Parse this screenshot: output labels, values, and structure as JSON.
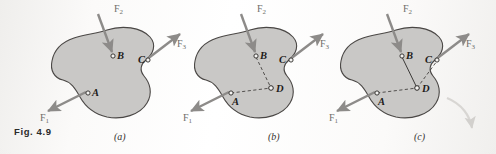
{
  "figure": {
    "caption": "Fig. 4.9",
    "colors": {
      "body_fill": "#c9c8c6",
      "body_stroke": "#4a4745",
      "arrow": "#8d8b89",
      "dashed_line": "#3c3a38",
      "solid_line": "#3c3a38",
      "label_text": "#1d1b1a",
      "force_text": "#6f6d6b",
      "caption_text": "#2b2b2b",
      "page_background": "#f7f6f4",
      "moment_arc": "#d8d6d3"
    }
  },
  "panels": [
    {
      "id": "a",
      "label": "(a)",
      "forces": [
        {
          "name": "F1",
          "label": "F",
          "sub": "1"
        },
        {
          "name": "F2",
          "label": "F",
          "sub": "2"
        },
        {
          "name": "F3",
          "label": "F",
          "sub": "3"
        }
      ],
      "points": [
        {
          "name": "A",
          "label": "A"
        },
        {
          "name": "B",
          "label": "B"
        },
        {
          "name": "C",
          "label": "C"
        }
      ],
      "has_point_d": false,
      "has_moment_arc": false
    },
    {
      "id": "b",
      "label": "(b)",
      "forces": [
        {
          "name": "F1",
          "label": "F",
          "sub": "1"
        },
        {
          "name": "F2",
          "label": "F",
          "sub": "2"
        },
        {
          "name": "F3",
          "label": "F",
          "sub": "3"
        }
      ],
      "points": [
        {
          "name": "A",
          "label": "A"
        },
        {
          "name": "B",
          "label": "B"
        },
        {
          "name": "C",
          "label": "C"
        },
        {
          "name": "D",
          "label": "D"
        }
      ],
      "has_point_d": true,
      "has_moment_arc": false
    },
    {
      "id": "c",
      "label": "(c)",
      "forces": [
        {
          "name": "F1",
          "label": "F",
          "sub": "1"
        },
        {
          "name": "F2",
          "label": "F",
          "sub": "2"
        },
        {
          "name": "F3",
          "label": "F",
          "sub": "3"
        }
      ],
      "points": [
        {
          "name": "A",
          "label": "A"
        },
        {
          "name": "B",
          "label": "B"
        },
        {
          "name": "C",
          "label": "C"
        },
        {
          "name": "D",
          "label": "D"
        }
      ],
      "has_point_d": true,
      "has_moment_arc": true
    }
  ],
  "labels": {
    "a": {
      "F1": "F",
      "F1sub": "1",
      "F2": "F",
      "F2sub": "2",
      "F3": "F",
      "F3sub": "3",
      "A": "A",
      "B": "B",
      "C": "C"
    },
    "b": {
      "F1": "F",
      "F1sub": "1",
      "F2": "F",
      "F2sub": "2",
      "F3": "F",
      "F3sub": "3",
      "A": "A",
      "B": "B",
      "C": "C",
      "D": "D"
    },
    "c": {
      "F1": "F",
      "F1sub": "1",
      "F2": "F",
      "F2sub": "2",
      "F3": "F",
      "F3sub": "3",
      "A": "A",
      "B": "B",
      "C": "C",
      "D": "D"
    }
  }
}
